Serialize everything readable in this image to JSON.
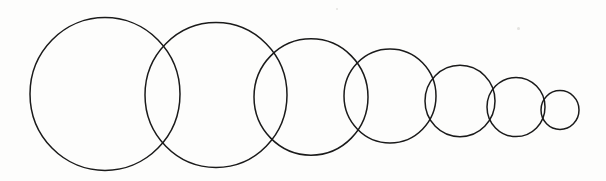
{
  "figure": {
    "title": "Overlapping circles decreasing in size",
    "medium": "hand-drawn ink line art scan",
    "background_color": "#fdfdfc",
    "stroke_color": "#1a1a1a",
    "canvas": {
      "width": 606,
      "height": 181
    },
    "caption": ""
  },
  "chart_data": {
    "type": "scatter",
    "title": "Overlapping circles decreasing in size",
    "xlabel": "",
    "ylabel": "",
    "xlim": [
      0,
      606
    ],
    "ylim": [
      0,
      181
    ],
    "grid": false,
    "legend": "none",
    "series": [
      {
        "name": "circles",
        "marker": "open-circle",
        "stroke": "#1a1a1a",
        "points": [
          {
            "label": "circle-1",
            "cx": 105,
            "cy": 94,
            "r": 75,
            "diameter": 150
          },
          {
            "label": "circle-2",
            "cx": 216,
            "cy": 95,
            "r": 71,
            "diameter": 142
          },
          {
            "label": "circle-3",
            "cx": 311,
            "cy": 97,
            "r": 57,
            "diameter": 114
          },
          {
            "label": "circle-4",
            "cx": 390,
            "cy": 96,
            "r": 46,
            "diameter": 92
          },
          {
            "label": "circle-5",
            "cx": 460,
            "cy": 101,
            "r": 35,
            "diameter": 70
          },
          {
            "label": "circle-6",
            "cx": 516,
            "cy": 107,
            "r": 29,
            "diameter": 58
          },
          {
            "label": "circle-7",
            "cx": 560,
            "cy": 110,
            "r": 19,
            "diameter": 38
          }
        ]
      }
    ],
    "annotations": []
  },
  "speckles": [
    {
      "x": 517,
      "y": 27,
      "w": 3,
      "h": 3
    },
    {
      "x": 336,
      "y": 8,
      "w": 2,
      "h": 2
    }
  ]
}
